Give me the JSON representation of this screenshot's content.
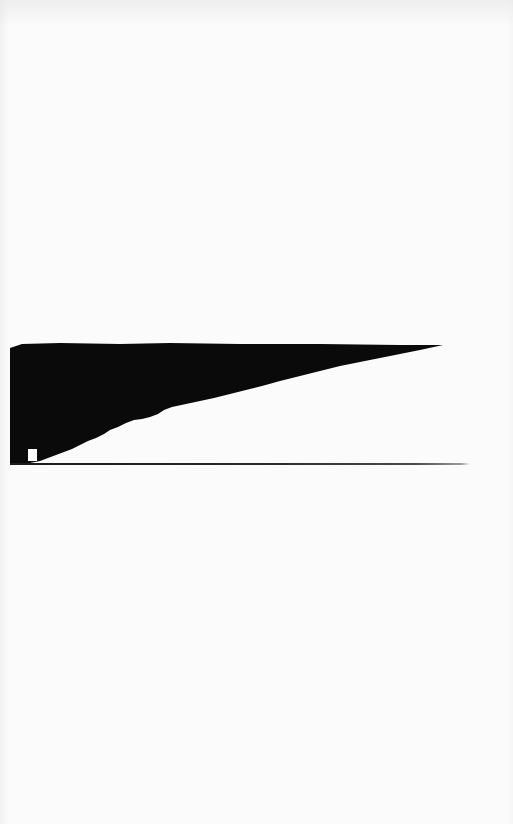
{
  "page": {
    "kind": "scanned-document-page",
    "width": 513,
    "height": 824,
    "background_color": "#fbfbfb",
    "ink_color": "#0a0a0a",
    "rule_color": "#1b1b1b",
    "notch_color": "#fdfdfd",
    "upper_region_label": "",
    "lower_region_label": "",
    "caption": "",
    "page_number": "",
    "header_text": "",
    "footer_text": ""
  },
  "figure": {
    "label": "",
    "title": "",
    "description": "",
    "ink_region_name": "solid-black-wedge",
    "baseline_name": "horizontal-rule",
    "notch_name": "blank-void-notch"
  },
  "chart_data": {
    "type": "area",
    "title": "",
    "xlabel": "",
    "ylabel": "",
    "grid": false,
    "legend": null,
    "xlim": [
      10,
      470
    ],
    "ylim": [
      343,
      464
    ],
    "note": "Solid black wedge region over a horizontal baseline rule; boundary traced as a stepped polygon in page pixel coordinates.",
    "series": [
      {
        "name": "wedge-top-edge",
        "points": [
          [
            10,
            348
          ],
          [
            22,
            344
          ],
          [
            60,
            343
          ],
          [
            120,
            344
          ],
          [
            170,
            343
          ],
          [
            240,
            344
          ],
          [
            320,
            344
          ],
          [
            400,
            345
          ],
          [
            443,
            345
          ]
        ]
      },
      {
        "name": "wedge-lower-edge",
        "points": [
          [
            443,
            345
          ],
          [
            420,
            350
          ],
          [
            400,
            354
          ],
          [
            380,
            358
          ],
          [
            360,
            362
          ],
          [
            340,
            366
          ],
          [
            320,
            371
          ],
          [
            300,
            376
          ],
          [
            280,
            381
          ],
          [
            262,
            386
          ],
          [
            246,
            390
          ],
          [
            230,
            394
          ],
          [
            214,
            398
          ],
          [
            200,
            401
          ],
          [
            186,
            404
          ],
          [
            172,
            407
          ],
          [
            164,
            410
          ],
          [
            158,
            414
          ],
          [
            150,
            417
          ],
          [
            142,
            419
          ],
          [
            134,
            420
          ],
          [
            126,
            423
          ],
          [
            118,
            427
          ],
          [
            110,
            430
          ],
          [
            104,
            434
          ],
          [
            96,
            438
          ],
          [
            88,
            441
          ],
          [
            80,
            445
          ],
          [
            72,
            449
          ],
          [
            64,
            452
          ],
          [
            56,
            455
          ],
          [
            48,
            458
          ],
          [
            40,
            461
          ],
          [
            30,
            463
          ],
          [
            18,
            464
          ],
          [
            10,
            464
          ]
        ]
      }
    ],
    "baseline": {
      "x_start": 10,
      "x_end": 470,
      "y": 464,
      "thickness": 2
    },
    "notch": {
      "x": 28,
      "y": 449,
      "width": 9,
      "height": 12
    }
  }
}
